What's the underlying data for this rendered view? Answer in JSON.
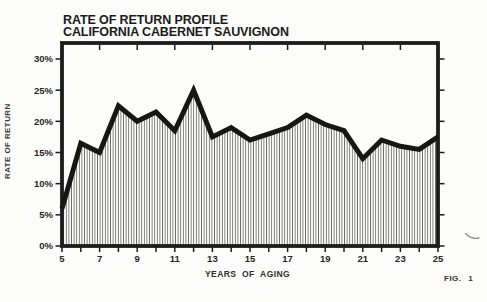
{
  "title": {
    "line1": "RATE OF RETURN PROFILE",
    "line2": "CALIFORNIA CABERNET SAUVIGNON"
  },
  "fig_label": "FIG. 1",
  "chart_data": {
    "type": "area",
    "title": "RATE OF RETURN PROFILE",
    "subtitle": "CALIFORNIA CABERNET SAUVIGNON",
    "xlabel": "YEARS OF AGING",
    "ylabel": "RATE OF RETURN",
    "x": [
      5,
      6,
      7,
      8,
      9,
      10,
      11,
      12,
      13,
      14,
      15,
      16,
      17,
      18,
      19,
      20,
      21,
      22,
      23,
      24,
      25
    ],
    "values": [
      6,
      16.5,
      15,
      22.5,
      20,
      21.5,
      18.5,
      25,
      17.5,
      19,
      17,
      18,
      19,
      21,
      19.5,
      18.5,
      14,
      17,
      16,
      15.5,
      17.5
    ],
    "xlim": [
      5,
      25
    ],
    "ylim": [
      0,
      30
    ],
    "x_major_ticks": [
      5,
      7,
      9,
      11,
      13,
      15,
      17,
      19,
      21,
      23,
      25
    ],
    "x_tick_labels": [
      "5",
      "7",
      "9",
      "11",
      "13",
      "15",
      "17",
      "19",
      "21",
      "23",
      "25"
    ],
    "top_ticks": [
      7,
      9,
      11,
      13,
      15,
      17,
      19,
      21,
      23
    ],
    "y_ticks": [
      0,
      5,
      10,
      15,
      20,
      25,
      30
    ],
    "y_tick_labels": [
      "0%",
      "5%",
      "10%",
      "15%",
      "20%",
      "25%",
      "30%"
    ],
    "grid": false,
    "legend_position": "none",
    "fill_style": "vertical-hatch",
    "line_color": "#161616",
    "hatch_color": "#6e6e6e",
    "frame_color": "#1c1c1c"
  }
}
